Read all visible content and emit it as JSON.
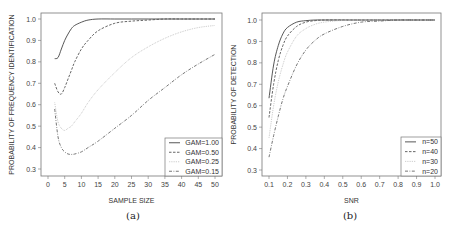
{
  "chart_data": [
    {
      "type": "line",
      "panel": "(a)",
      "title": "",
      "xlabel": "SAMPLE SIZE",
      "ylabel": "PROBABILITY OF FREQUENCY IDENTIFICATION",
      "xlim": [
        0,
        50
      ],
      "ylim": [
        0.3,
        1.0
      ],
      "xticks": [
        "0",
        "5",
        "10",
        "15",
        "20",
        "25",
        "30",
        "35",
        "40",
        "45",
        "50"
      ],
      "yticks": [
        "0.3",
        "0.4",
        "0.5",
        "0.6",
        "0.7",
        "0.8",
        "0.9",
        "1.0"
      ],
      "grid": false,
      "legend_position": "bottom-right",
      "x": [
        2,
        3,
        4,
        5,
        6,
        7,
        8,
        10,
        12,
        15,
        20,
        25,
        30,
        35,
        40,
        45,
        50
      ],
      "series": [
        {
          "name": "GAM=1.00",
          "style": "solid",
          "color": "#444444",
          "values": [
            0.815,
            0.82,
            0.86,
            0.9,
            0.93,
            0.955,
            0.97,
            0.985,
            0.995,
            1.0,
            1.0,
            1.0,
            1.0,
            1.0,
            1.0,
            1.0,
            1.0
          ]
        },
        {
          "name": "GAM=0.50",
          "style": "dashed",
          "color": "#555555",
          "values": [
            0.7,
            0.66,
            0.65,
            0.68,
            0.72,
            0.76,
            0.8,
            0.86,
            0.9,
            0.945,
            0.98,
            0.99,
            0.995,
            1.0,
            1.0,
            1.0,
            1.0
          ]
        },
        {
          "name": "GAM=0.25",
          "style": "dotted",
          "color": "#bbbbbb",
          "values": [
            0.61,
            0.52,
            0.49,
            0.48,
            0.49,
            0.5,
            0.52,
            0.56,
            0.61,
            0.67,
            0.75,
            0.82,
            0.87,
            0.91,
            0.94,
            0.96,
            0.97
          ]
        },
        {
          "name": "GAM=0.15",
          "style": "dashdot",
          "color": "#666666",
          "values": [
            0.58,
            0.45,
            0.4,
            0.38,
            0.37,
            0.368,
            0.37,
            0.38,
            0.4,
            0.43,
            0.49,
            0.55,
            0.62,
            0.68,
            0.74,
            0.79,
            0.835
          ]
        }
      ]
    },
    {
      "type": "line",
      "panel": "(b)",
      "title": "",
      "xlabel": "SNR",
      "ylabel": "PROBABILITY OF DETECTION",
      "xlim": [
        0.1,
        1.0
      ],
      "ylim": [
        0.3,
        1.0
      ],
      "xticks": [
        "0.1",
        "0.2",
        "0.3",
        "0.4",
        "0.5",
        "0.6",
        "0.7",
        "0.8",
        "0.9",
        "1.0"
      ],
      "yticks": [
        "0.3",
        "0.4",
        "0.5",
        "0.6",
        "0.7",
        "0.8",
        "0.9",
        "1.0"
      ],
      "grid": false,
      "legend_position": "bottom-right",
      "x": [
        0.1,
        0.125,
        0.15,
        0.175,
        0.2,
        0.25,
        0.3,
        0.35,
        0.4,
        0.5,
        0.6,
        0.7,
        0.8,
        0.9,
        1.0
      ],
      "series": [
        {
          "name": "n=50",
          "style": "solid",
          "color": "#444444",
          "values": [
            0.635,
            0.79,
            0.88,
            0.935,
            0.965,
            0.99,
            0.997,
            1.0,
            1.0,
            1.0,
            1.0,
            1.0,
            1.0,
            1.0,
            1.0
          ]
        },
        {
          "name": "n=40",
          "style": "dashed",
          "color": "#555555",
          "values": [
            0.545,
            0.7,
            0.81,
            0.88,
            0.925,
            0.97,
            0.99,
            0.997,
            1.0,
            1.0,
            1.0,
            1.0,
            1.0,
            1.0,
            1.0
          ]
        },
        {
          "name": "n=30",
          "style": "dotted",
          "color": "#bbbbbb",
          "values": [
            0.45,
            0.6,
            0.71,
            0.79,
            0.85,
            0.925,
            0.96,
            0.98,
            0.99,
            0.998,
            1.0,
            1.0,
            1.0,
            1.0,
            1.0
          ]
        },
        {
          "name": "n=20",
          "style": "dashdot",
          "color": "#666666",
          "values": [
            0.36,
            0.46,
            0.55,
            0.63,
            0.69,
            0.79,
            0.86,
            0.905,
            0.935,
            0.97,
            0.99,
            0.995,
            1.0,
            1.0,
            1.0
          ]
        }
      ]
    }
  ]
}
